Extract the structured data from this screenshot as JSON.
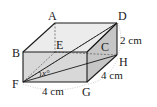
{
  "figure": {
    "type": "cuboid",
    "vertices": {
      "A": "A",
      "B": "B",
      "C": "C",
      "D": "D",
      "E": "E",
      "F": "F",
      "G": "G",
      "H": "H"
    },
    "dimensions": {
      "fg": "4 cm",
      "gh": "4 cm",
      "dh": "2 cm"
    },
    "angle_label": "x°",
    "colors": {
      "edge": "#1a1a1a",
      "top_face": "#e9e9e9",
      "front_face": "#d6d6d6",
      "side_face": "#c4c4c4",
      "dashed": "#555555",
      "dotted_arc": "#aaaaaa"
    }
  }
}
